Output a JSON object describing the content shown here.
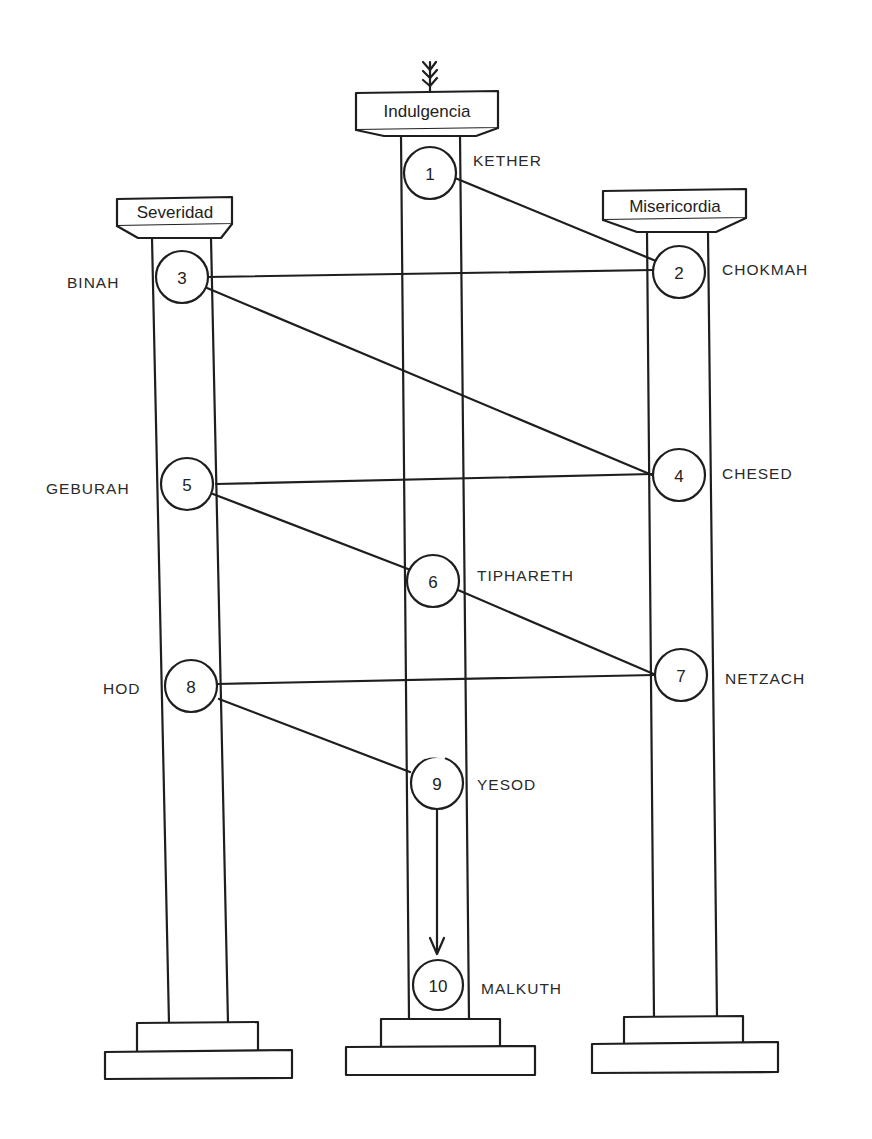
{
  "diagram": {
    "type": "tree-of-life-pillars",
    "stroke_color": "#1e1e1e",
    "background": "#ffffff",
    "pillars": [
      {
        "id": "left",
        "capital": "Severidad"
      },
      {
        "id": "middle",
        "capital": "Indulgencia"
      },
      {
        "id": "right",
        "capital": "Misericordia"
      }
    ],
    "sephiroth": [
      {
        "num": "1",
        "name": "KETHER",
        "pillar": "middle"
      },
      {
        "num": "2",
        "name": "CHOKMAH",
        "pillar": "right"
      },
      {
        "num": "3",
        "name": "BINAH",
        "pillar": "left"
      },
      {
        "num": "4",
        "name": "CHESED",
        "pillar": "right"
      },
      {
        "num": "5",
        "name": "GEBURAH",
        "pillar": "left"
      },
      {
        "num": "6",
        "name": "TIPHARETH",
        "pillar": "middle"
      },
      {
        "num": "7",
        "name": "NETZACH",
        "pillar": "right"
      },
      {
        "num": "8",
        "name": "HOD",
        "pillar": "left"
      },
      {
        "num": "9",
        "name": "YESOD",
        "pillar": "middle"
      },
      {
        "num": "10",
        "name": "MALKUTH",
        "pillar": "middle"
      }
    ],
    "paths": [
      {
        "from": "1",
        "to": "2"
      },
      {
        "from": "2",
        "to": "3"
      },
      {
        "from": "3",
        "to": "4"
      },
      {
        "from": "4",
        "to": "5"
      },
      {
        "from": "5",
        "to": "6"
      },
      {
        "from": "6",
        "to": "7"
      },
      {
        "from": "7",
        "to": "8"
      },
      {
        "from": "8",
        "to": "9"
      },
      {
        "from": "9",
        "to": "10",
        "arrow": true
      }
    ],
    "top_symbol": "lightning-flash-icon"
  }
}
